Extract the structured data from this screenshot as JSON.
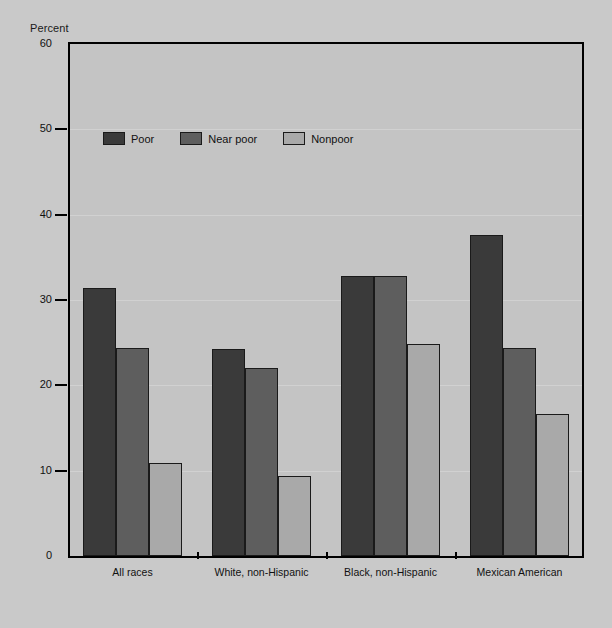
{
  "chart_data": {
    "type": "bar",
    "title": "",
    "xlabel": "",
    "ylabel": "Percent",
    "ylim": [
      0,
      60
    ],
    "yticks": [
      0,
      10,
      20,
      30,
      40,
      50,
      60
    ],
    "grid": true,
    "legend_position": "inside-top-left",
    "categories": [
      "All races",
      "White, non-Hispanic",
      "Black, non-Hispanic",
      "Mexican American"
    ],
    "series": [
      {
        "name": "Poor",
        "color": "#3a3a3a",
        "values": [
          31.4,
          24.3,
          32.8,
          37.6
        ]
      },
      {
        "name": "Near poor",
        "color": "#5e5e5e",
        "values": [
          24.4,
          22.0,
          32.8,
          24.4
        ]
      },
      {
        "name": "Nonpoor",
        "color": "#a9a9a9",
        "values": [
          10.9,
          9.4,
          24.9,
          16.7
        ]
      }
    ]
  },
  "axis": {
    "y_title": "Percent"
  },
  "colors": {
    "plot_background": "#c4c4c4",
    "page_background": "#c9c9c9",
    "frame": "#000000",
    "gridline": "#d6d6d6",
    "text": "#111111"
  }
}
